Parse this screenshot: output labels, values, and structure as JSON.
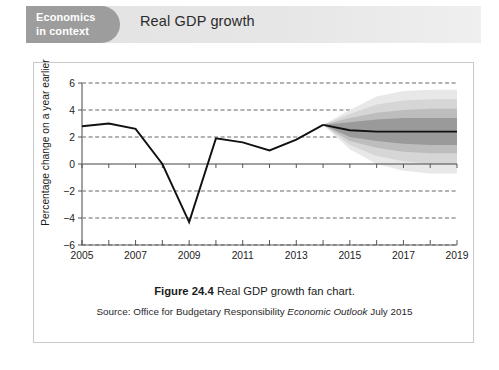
{
  "header": {
    "pill_line1": "Economics",
    "pill_line2": "in context",
    "title": "Real GDP growth",
    "pill_color": "#9d9d9d",
    "band_color": "#e5e5e5"
  },
  "caption": {
    "figure_label": "Figure 24.4",
    "figure_text": "Real GDP growth fan chart.",
    "source_prefix": "Source: Office for Budgetary Responsibility",
    "source_italic": "Economic Outlook",
    "source_suffix": "July 2015"
  },
  "chart_data": {
    "type": "line",
    "title": "Real GDP growth",
    "xlabel": "",
    "ylabel": "Percentage change on a year earlier",
    "xlim": [
      2005,
      2019
    ],
    "ylim": [
      -6,
      6
    ],
    "yticks": [
      6,
      4,
      2,
      0,
      -2,
      -4,
      -6
    ],
    "ytick_labels": [
      "6",
      "4",
      "2",
      "0",
      "−2",
      "−4",
      "−6"
    ],
    "xticks": [
      2005,
      2006,
      2007,
      2008,
      2009,
      2010,
      2011,
      2012,
      2013,
      2014,
      2015,
      2016,
      2017,
      2018,
      2019
    ],
    "xtick_labels": [
      "2005",
      "",
      "2007",
      "",
      "2009",
      "",
      "2011",
      "",
      "2013",
      "",
      "2015",
      "",
      "2017",
      "",
      "2019"
    ],
    "xtick_labels_shown": [
      "2005",
      "2007",
      "2009",
      "2011",
      "2013",
      "2015",
      "2017",
      "2019"
    ],
    "grid": "horizontal-dashed",
    "legend": "none",
    "series": [
      {
        "name": "Real GDP growth (outturn)",
        "color": "#111111",
        "x": [
          2005,
          2006,
          2007,
          2008,
          2009,
          2010,
          2011,
          2012,
          2013,
          2014
        ],
        "values": [
          2.8,
          3.0,
          2.6,
          0.0,
          -4.3,
          1.9,
          1.6,
          1.0,
          1.8,
          2.9
        ]
      },
      {
        "name": "Real GDP growth (central forecast)",
        "color": "#111111",
        "x": [
          2014,
          2015,
          2016,
          2017,
          2018,
          2019
        ],
        "values": [
          2.9,
          2.5,
          2.4,
          2.4,
          2.4,
          2.4
        ]
      }
    ],
    "fan_bands": [
      {
        "name": "90% probability band",
        "color": "#e8e8e8",
        "x": [
          2014,
          2015,
          2016,
          2017,
          2018,
          2019
        ],
        "upper": [
          2.9,
          4.0,
          5.0,
          5.4,
          5.5,
          5.5
        ],
        "lower": [
          2.9,
          1.1,
          0.0,
          -0.5,
          -0.7,
          -0.7
        ]
      },
      {
        "name": "70% probability band",
        "color": "#d6d6d6",
        "x": [
          2014,
          2015,
          2016,
          2017,
          2018,
          2019
        ],
        "upper": [
          2.9,
          3.7,
          4.4,
          4.7,
          4.8,
          4.8
        ],
        "lower": [
          2.9,
          1.4,
          0.6,
          0.2,
          0.0,
          0.0
        ]
      },
      {
        "name": "50% probability band",
        "color": "#bdbdbd",
        "x": [
          2014,
          2015,
          2016,
          2017,
          2018,
          2019
        ],
        "upper": [
          2.9,
          3.4,
          3.8,
          4.0,
          4.1,
          4.1
        ],
        "lower": [
          2.9,
          1.7,
          1.2,
          0.9,
          0.8,
          0.8
        ]
      },
      {
        "name": "30% probability band",
        "color": "#9a9a9a",
        "x": [
          2014,
          2015,
          2016,
          2017,
          2018,
          2019
        ],
        "upper": [
          2.9,
          3.1,
          3.3,
          3.4,
          3.4,
          3.4
        ],
        "lower": [
          2.9,
          2.0,
          1.7,
          1.5,
          1.4,
          1.4
        ]
      }
    ]
  }
}
